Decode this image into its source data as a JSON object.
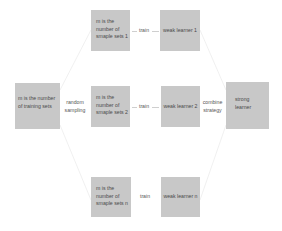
{
  "diagram": {
    "training_box": {
      "text": "m is the number of training sets"
    },
    "sampling_label": {
      "line1": "random",
      "line2": "sampling"
    },
    "sample_sets": [
      {
        "line1": "m is the",
        "line2": "number of",
        "line3": "smaple sets  1"
      },
      {
        "line1": "m is the",
        "line2": "number of",
        "line3": "smaple sets  2"
      },
      {
        "line1": "m is the",
        "line2": "number of",
        "line3": "smaple sets  n"
      }
    ],
    "train_labels": [
      "train",
      "train",
      "train"
    ],
    "weak_learners": [
      "weak learner 1",
      "weak learner 2",
      "weak learner n"
    ],
    "combine_label": {
      "line1": "combine",
      "line2": "strategy"
    },
    "strong_learner": {
      "line1": "strong",
      "line2": "learner"
    },
    "colors": {
      "box_fill": "#c8c8c8",
      "text": "#4a4a4a",
      "connector": "#cfcfcf"
    }
  }
}
